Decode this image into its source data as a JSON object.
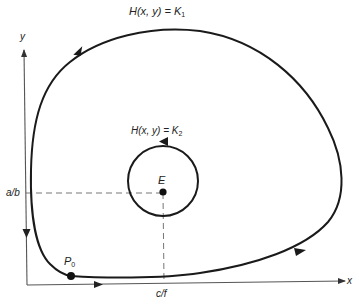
{
  "diagram": {
    "axes": {
      "x_label": "x",
      "y_label": "y"
    },
    "curves": [
      {
        "label_main": "H(x, y) = K",
        "label_sub": "1",
        "type": "closed-orbit",
        "direction": "counterclockwise"
      },
      {
        "label_main": "H(x, y) = K",
        "label_sub": "2",
        "type": "closed-orbit",
        "direction": "counterclockwise"
      }
    ],
    "points": [
      {
        "label": "E",
        "description": "equilibrium point"
      },
      {
        "label_main": "P",
        "label_sub": "0",
        "description": "initial point"
      }
    ],
    "ticks": {
      "y_tick": "a/b",
      "x_tick": "c/f"
    },
    "colors": {
      "stroke": "#1a1a1a",
      "axis": "#555555",
      "dash": "#666666"
    }
  }
}
